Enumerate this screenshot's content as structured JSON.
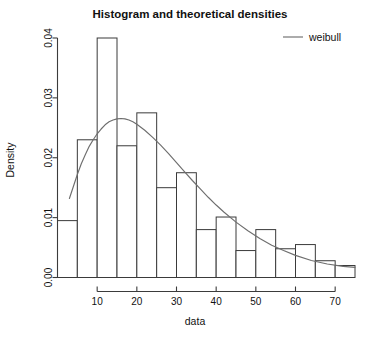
{
  "chart_data": {
    "type": "bar",
    "title": "Histogram and theoretical densities",
    "xlabel": "data",
    "ylabel": "Density",
    "xlim": [
      0,
      75
    ],
    "ylim": [
      0.0,
      0.04
    ],
    "grid": false,
    "legend_position": "top-right",
    "x_ticks": [
      10,
      20,
      30,
      40,
      50,
      60,
      70
    ],
    "x_tick_labels": [
      "10",
      "20",
      "30",
      "40",
      "50",
      "60",
      "70"
    ],
    "y_ticks": [
      0.0,
      0.01,
      0.02,
      0.03,
      0.04
    ],
    "y_tick_labels": [
      "0.00",
      "0.01",
      "0.02",
      "0.03",
      "0.04"
    ],
    "bin_width": 5,
    "bin_edges": [
      0,
      5,
      10,
      15,
      20,
      25,
      30,
      35,
      40,
      45,
      50,
      55,
      60,
      65,
      70,
      75
    ],
    "categories": [
      "0-5",
      "5-10",
      "10-15",
      "15-20",
      "20-25",
      "25-30",
      "30-35",
      "35-40",
      "40-45",
      "45-50",
      "50-55",
      "55-60",
      "60-65",
      "65-70",
      "70-75"
    ],
    "values": [
      0.0095,
      0.023,
      0.04,
      0.022,
      0.0275,
      0.015,
      0.0175,
      0.008,
      0.0101,
      0.0045,
      0.008,
      0.0048,
      0.0055,
      0.0028,
      0.002
    ],
    "series": [
      {
        "name": "weibull",
        "type": "line",
        "x": [
          3,
          4,
          5,
          6,
          7,
          8,
          9,
          10,
          11,
          12,
          13,
          14,
          15,
          16,
          17,
          18,
          19,
          20,
          22,
          24,
          26,
          28,
          30,
          32,
          34,
          36,
          38,
          40,
          42,
          45,
          48,
          51,
          54,
          57,
          60,
          64,
          68,
          72,
          75
        ],
        "y": [
          0.0132,
          0.0152,
          0.0172,
          0.019,
          0.0205,
          0.0219,
          0.023,
          0.024,
          0.0248,
          0.0255,
          0.026,
          0.0263,
          0.0265,
          0.02655,
          0.0265,
          0.0263,
          0.026,
          0.0256,
          0.0246,
          0.0234,
          0.0221,
          0.0207,
          0.0192,
          0.0177,
          0.0162,
          0.0148,
          0.0134,
          0.0121,
          0.0109,
          0.00925,
          0.0078,
          0.0065,
          0.0054,
          0.0045,
          0.0037,
          0.00285,
          0.00225,
          0.00185,
          0.0017
        ]
      }
    ],
    "legend": [
      {
        "label": "weibull",
        "marker": "line",
        "color": "#6e6e6e"
      }
    ],
    "colors": {
      "bar_fill": "#ffffff",
      "bar_stroke": "#3a3a3a",
      "curve": "#6e6e6e",
      "axis": "#3b3b3b",
      "text": "#111111",
      "background": "#ffffff"
    }
  }
}
